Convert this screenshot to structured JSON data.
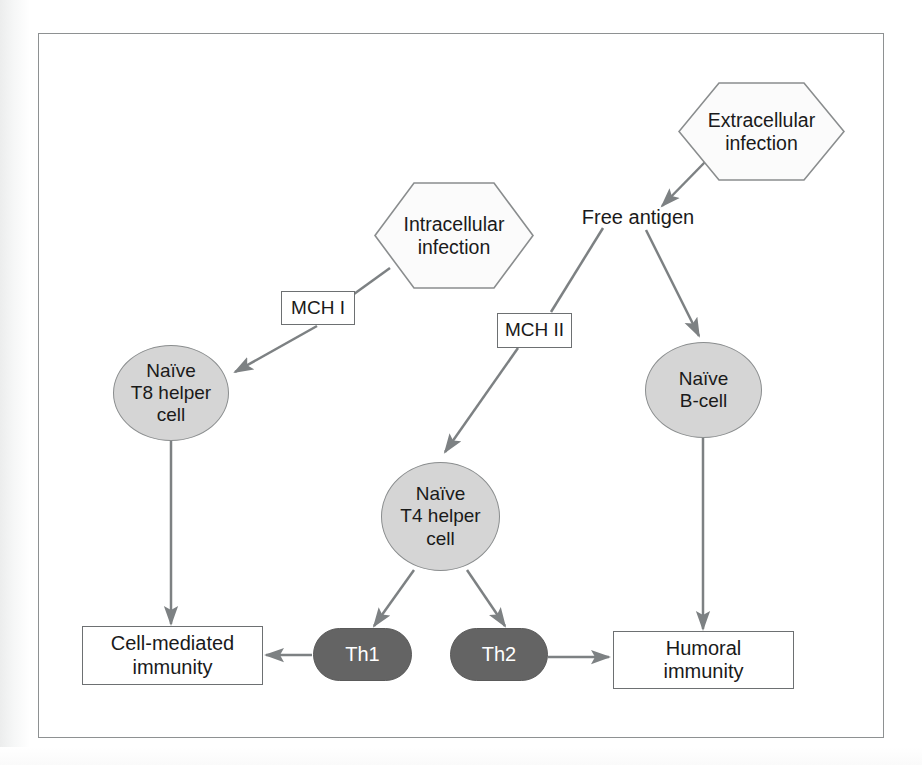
{
  "figure": {
    "frame": {
      "border_color": "#8e9192",
      "background": "#ffffff"
    }
  },
  "palette": {
    "hexagon_fill": "#fbfbfb",
    "hexagon_stroke": "#8a8d8e",
    "rect_fill": "#ffffff",
    "rect_stroke": "#6d7072",
    "ellipse_fill": "#d5d5d5",
    "ellipse_stroke": "#8a8d8e",
    "pill_fill": "#646464",
    "pill_text": "#ffffff",
    "arrow_color": "#7d8183",
    "text_color": "#1a1a1a"
  },
  "nodes": {
    "extracellular_infection": {
      "label": "Extracellular infection",
      "line1": "Extracellular",
      "line2": "infection",
      "shape": "hexagon"
    },
    "intracellular_infection": {
      "label": "Intracellular infection",
      "line1": "Intracellular",
      "line2": "infection",
      "shape": "hexagon"
    },
    "free_antigen": {
      "label": "Free antigen",
      "shape": "text"
    },
    "mch_1": {
      "label": "MCH I",
      "shape": "rectangle"
    },
    "mch_2": {
      "label": "MCH II",
      "shape": "rectangle"
    },
    "naive_t8_helper_cell": {
      "label": "Naïve T8 helper cell",
      "line1": "Naïve",
      "line2": "T8 helper",
      "line3": "cell",
      "shape": "ellipse"
    },
    "naive_t4_helper_cell": {
      "label": "Naïve T4 helper cell",
      "line1": "Naïve",
      "line2": "T4 helper",
      "line3": "cell",
      "shape": "ellipse"
    },
    "naive_b_cell": {
      "label": "Naïve B-cell",
      "line1": "Naïve",
      "line2": "B-cell",
      "shape": "ellipse"
    },
    "th1": {
      "label": "Th1",
      "shape": "pill"
    },
    "th2": {
      "label": "Th2",
      "shape": "pill"
    },
    "cell_mediated_immunity": {
      "label": "Cell-mediated immunity",
      "line1": "Cell-mediated",
      "line2": "immunity",
      "shape": "rectangle"
    },
    "humoral_immunity": {
      "label": "Humoral immunity",
      "line1": "Humoral",
      "line2": "immunity",
      "shape": "rectangle"
    }
  },
  "edges": [
    {
      "from": "extracellular_infection",
      "to": "free_antigen",
      "arrow": true
    },
    {
      "from": "intracellular_infection",
      "to": "mch_1",
      "arrow": false
    },
    {
      "from": "mch_1",
      "to": "naive_t8_helper_cell",
      "arrow": true
    },
    {
      "from": "free_antigen",
      "to": "mch_2",
      "arrow": false
    },
    {
      "from": "mch_2",
      "to": "naive_t4_helper_cell",
      "arrow": true
    },
    {
      "from": "free_antigen",
      "to": "naive_b_cell",
      "arrow": true
    },
    {
      "from": "naive_t8_helper_cell",
      "to": "cell_mediated_immunity",
      "arrow": true
    },
    {
      "from": "naive_t4_helper_cell",
      "to": "th1",
      "arrow": true
    },
    {
      "from": "naive_t4_helper_cell",
      "to": "th2",
      "arrow": true
    },
    {
      "from": "naive_b_cell",
      "to": "humoral_immunity",
      "arrow": true
    },
    {
      "from": "th1",
      "to": "cell_mediated_immunity",
      "arrow": true
    },
    {
      "from": "th2",
      "to": "humoral_immunity",
      "arrow": true
    }
  ]
}
